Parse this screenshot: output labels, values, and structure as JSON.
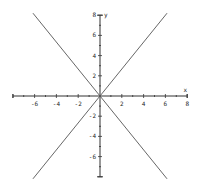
{
  "chart_data": {
    "type": "line",
    "title": "",
    "xlabel": "x",
    "ylabel": "y",
    "xlim": [
      -8,
      8
    ],
    "ylim": [
      -8,
      8
    ],
    "grid": false,
    "x_ticks": [
      -6,
      -4,
      -2,
      2,
      4,
      6,
      8
    ],
    "y_ticks": [
      8,
      6,
      4,
      2,
      -2,
      -4,
      -6
    ],
    "series": [
      {
        "name": "y = 4/3 x",
        "x": [
          -6.15,
          6.15
        ],
        "y": [
          -8.2,
          8.2
        ]
      },
      {
        "name": "y = -4/3 x",
        "x": [
          -6.15,
          6.15
        ],
        "y": [
          8.2,
          -8.2
        ]
      }
    ],
    "colors": {
      "line": "#555555",
      "axis": "#333333"
    }
  }
}
